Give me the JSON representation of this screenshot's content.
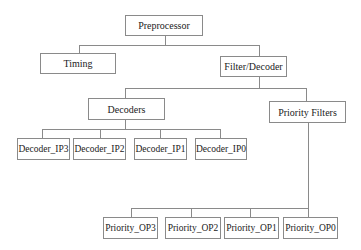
{
  "diagram": {
    "type": "hierarchy-tree",
    "line_color": "#8a8a8a",
    "root": {
      "label": "Preprocessor",
      "children": [
        {
          "label": "Timing"
        },
        {
          "label": "Filter/Decoder",
          "children": [
            {
              "label": "Decoders",
              "children": [
                {
                  "label": "Decoder_IP3"
                },
                {
                  "label": "Decoder_IP2"
                },
                {
                  "label": "Decoder_IP1"
                },
                {
                  "label": "Decoder_IP0"
                }
              ]
            },
            {
              "label": "Priority Filters",
              "children": [
                {
                  "label": "Priority_OP3"
                },
                {
                  "label": "Priority_OP2"
                },
                {
                  "label": "Priority_OP1"
                },
                {
                  "label": "Priority_OP0"
                }
              ]
            }
          ]
        }
      ]
    }
  },
  "nodes": {
    "preprocessor": "Preprocessor",
    "timing": "Timing",
    "filter_decoder": "Filter/Decoder",
    "decoders": "Decoders",
    "priority_filters": "Priority Filters",
    "decoder_ip3": "Decoder_IP3",
    "decoder_ip2": "Decoder_IP2",
    "decoder_ip1": "Decoder_IP1",
    "decoder_ip0": "Decoder_IP0",
    "priority_op3": "Priority_OP3",
    "priority_op2": "Priority_OP2",
    "priority_op1": "Priority_OP1",
    "priority_op0": "Priority_OP0"
  }
}
